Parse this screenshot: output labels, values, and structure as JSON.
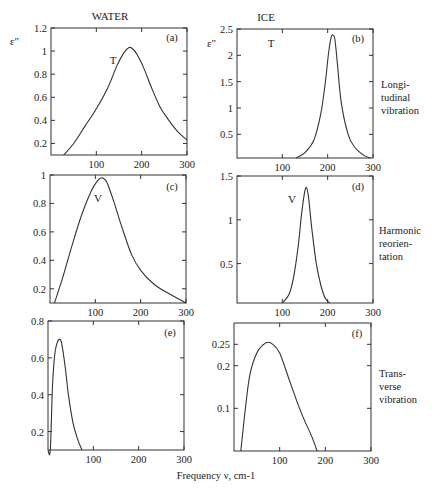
{
  "figure": {
    "column_titles": [
      "WATER",
      "ICE"
    ],
    "y_symbol": "ε\"",
    "xlabel": "Frequency ν, cm-1",
    "row_labels": [
      [
        "Longi-",
        "tudinal",
        "vibration"
      ],
      [
        "Harmonic",
        "reorien-",
        "tation"
      ],
      [
        "Trans-",
        "verse",
        "vibration"
      ]
    ],
    "line_color": "#333333"
  },
  "chart_data": [
    {
      "type": "line",
      "panel": "(a)",
      "title": "WATER",
      "peak_label": "T",
      "xlabel": "",
      "ylabel": "ε\"",
      "xlim": [
        0,
        300
      ],
      "ylim": [
        0.1,
        1.2
      ],
      "xticks": [
        100,
        200,
        300
      ],
      "yticks": [
        0.2,
        0.4,
        0.6,
        0.8,
        1,
        1.2
      ],
      "ytick_labels": [
        "0.2",
        "0.4",
        "0.6",
        "0.8",
        "1",
        "1.2"
      ],
      "x": [
        28,
        50,
        75,
        100,
        125,
        145,
        160,
        172,
        180,
        190,
        205,
        220,
        240,
        260,
        280,
        300
      ],
      "y": [
        0.1,
        0.2,
        0.35,
        0.5,
        0.68,
        0.87,
        0.98,
        1.03,
        1.02,
        0.97,
        0.85,
        0.7,
        0.52,
        0.4,
        0.3,
        0.23
      ]
    },
    {
      "type": "line",
      "panel": "(b)",
      "title": "ICE",
      "peak_label": "T",
      "xlabel": "",
      "ylabel": "ε\"",
      "xlim": [
        0,
        300
      ],
      "ylim": [
        0.05,
        2.5
      ],
      "xticks": [
        100,
        200,
        300
      ],
      "yticks": [
        0.5,
        1,
        1.5,
        2,
        2.5
      ],
      "ytick_labels": [
        "0.5",
        "1",
        "1.5",
        "2",
        "2.5"
      ],
      "x": [
        130,
        150,
        170,
        185,
        195,
        202,
        208,
        212,
        216,
        222,
        230,
        245,
        260,
        280,
        295
      ],
      "y": [
        0.05,
        0.15,
        0.4,
        0.9,
        1.5,
        2.05,
        2.35,
        2.38,
        2.3,
        1.8,
        1.1,
        0.5,
        0.25,
        0.1,
        0.05
      ]
    },
    {
      "type": "line",
      "panel": "(c)",
      "peak_label": "V",
      "xlabel": "",
      "ylabel": "",
      "xlim": [
        0,
        300
      ],
      "ylim": [
        0.1,
        1.0
      ],
      "xticks": [
        100,
        200,
        300
      ],
      "yticks": [
        0.2,
        0.4,
        0.6,
        0.8,
        1
      ],
      "ytick_labels": [
        "0.2",
        "0.4",
        "0.6",
        "0.8",
        "1"
      ],
      "x": [
        10,
        30,
        50,
        70,
        90,
        105,
        115,
        125,
        140,
        160,
        180,
        200,
        230,
        260,
        300
      ],
      "y": [
        0.1,
        0.3,
        0.52,
        0.72,
        0.88,
        0.96,
        0.98,
        0.95,
        0.82,
        0.62,
        0.44,
        0.33,
        0.23,
        0.17,
        0.1
      ]
    },
    {
      "type": "line",
      "panel": "(d)",
      "peak_label": "V",
      "xlabel": "",
      "ylabel": "",
      "xlim": [
        0,
        300
      ],
      "ylim": [
        0.05,
        1.5
      ],
      "xticks": [
        100,
        200,
        300
      ],
      "yticks": [
        0.5,
        1,
        1.5
      ],
      "ytick_labels": [
        "0.5",
        "1",
        "1.5"
      ],
      "x": [
        100,
        115,
        125,
        135,
        142,
        148,
        153,
        158,
        165,
        175,
        185,
        195,
        205
      ],
      "y": [
        0.05,
        0.15,
        0.35,
        0.7,
        1.05,
        1.28,
        1.37,
        1.25,
        0.9,
        0.5,
        0.25,
        0.1,
        0.05
      ]
    },
    {
      "type": "line",
      "panel": "(e)",
      "xlabel": "",
      "ylabel": "",
      "xlim": [
        0,
        300
      ],
      "ylim": [
        0.1,
        0.8
      ],
      "xticks": [
        100,
        200,
        300
      ],
      "yticks": [
        0.2,
        0.4,
        0.6,
        0.8
      ],
      "ytick_labels": [
        "0.2",
        "0.4",
        "0.6",
        "0.8"
      ],
      "x": [
        0,
        5,
        10,
        15,
        20,
        25,
        30,
        38,
        45,
        55,
        65,
        75
      ],
      "y": [
        0.1,
        0.1,
        0.45,
        0.62,
        0.68,
        0.7,
        0.68,
        0.55,
        0.4,
        0.25,
        0.16,
        0.1
      ]
    },
    {
      "type": "line",
      "panel": "(f)",
      "xlabel": "Frequency ν, cm-1",
      "ylabel": "",
      "xlim": [
        0,
        300
      ],
      "ylim": [
        0,
        0.3
      ],
      "xticks": [
        100,
        200,
        300
      ],
      "yticks": [
        0.1,
        0.2,
        0.25
      ],
      "ytick_labels": [
        "0.1",
        "0.2",
        "0.25"
      ],
      "x": [
        15,
        25,
        35,
        50,
        65,
        75,
        85,
        100,
        120,
        140,
        155,
        170,
        182
      ],
      "y": [
        0,
        0.1,
        0.18,
        0.23,
        0.25,
        0.255,
        0.25,
        0.23,
        0.17,
        0.11,
        0.07,
        0.035,
        0
      ]
    }
  ]
}
